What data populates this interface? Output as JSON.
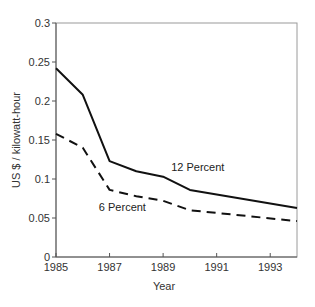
{
  "chart_data": {
    "type": "line",
    "title": "",
    "xlabel": "Year",
    "ylabel": "US $ / kilowatt-hour",
    "xlim": [
      1985,
      1994
    ],
    "ylim": [
      0,
      0.3
    ],
    "grid": false,
    "legend": "inline labels",
    "x_ticks": [
      1985,
      1987,
      1989,
      1991,
      1993
    ],
    "x_tick_labels": [
      "1985",
      "1987",
      "1989",
      "1991",
      "1993"
    ],
    "y_ticks": [
      0,
      0.05,
      0.1,
      0.15,
      0.2,
      0.25,
      0.3
    ],
    "y_tick_labels": [
      "0",
      "0.05",
      "0.1",
      "0.15",
      "0.2",
      "0.25",
      "0.3"
    ],
    "series": [
      {
        "name": "12 Percent",
        "style": "solid",
        "color": "#111111",
        "x": [
          1985,
          1986,
          1987,
          1988,
          1989,
          1990,
          1994
        ],
        "values": [
          0.242,
          0.208,
          0.123,
          0.11,
          0.103,
          0.086,
          0.063
        ]
      },
      {
        "name": "6 Percent",
        "style": "dashed",
        "color": "#111111",
        "x": [
          1985,
          1986,
          1987,
          1988,
          1989,
          1990,
          1994
        ],
        "values": [
          0.158,
          0.14,
          0.086,
          0.078,
          0.072,
          0.06,
          0.046
        ]
      }
    ],
    "annotations": [
      {
        "text": "12 Percent",
        "x": 1989.3,
        "y": 0.115
      },
      {
        "text": "6 Percent",
        "x": 1986.6,
        "y": 0.064
      }
    ]
  }
}
